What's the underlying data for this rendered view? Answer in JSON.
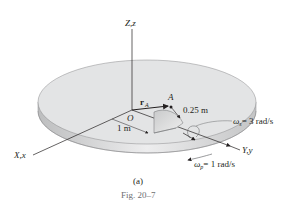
{
  "figure": {
    "caption": "Fig. 20–7",
    "sublabel": "(a)"
  },
  "axes": {
    "z_label": "Z,z",
    "x_label": "X,x",
    "y_label": "Y,y"
  },
  "points": {
    "origin": "O",
    "point_a": "A",
    "position_vector": "r",
    "position_vector_sub": "A"
  },
  "dimensions": {
    "disk_radius": "0.25 m",
    "offset": "1 m"
  },
  "angular_velocities": {
    "spin_symbol": "ω",
    "spin_sub": "s",
    "spin_value": "= 3 rad/s",
    "precession_symbol": "ω",
    "precession_sub": "p",
    "precession_value": "= 1 rad/s"
  },
  "colors": {
    "platform_top": "#e3e4e5",
    "platform_edge": "#c9cacb",
    "half_disk": "#d5d6d7",
    "line": "#231f20",
    "caption": "#6d6e71"
  }
}
